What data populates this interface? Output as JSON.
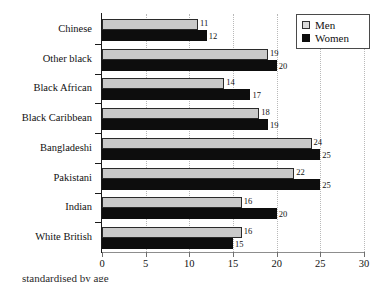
{
  "chart_data": {
    "type": "bar",
    "orientation": "horizontal",
    "title": "",
    "xlabel": "",
    "ylabel": "",
    "xlim": [
      0,
      30
    ],
    "xticks": [
      0,
      5,
      10,
      15,
      20,
      25,
      30
    ],
    "grid": true,
    "grid_axis": "x",
    "legend_position": "top-right",
    "categories": [
      "Chinese",
      "Other black",
      "Black African",
      "Black Caribbean",
      "Bangladeshi",
      "Pakistani",
      "Indian",
      "White British"
    ],
    "series": [
      {
        "name": "Men",
        "color": "#c9c9c9",
        "values": [
          11,
          19,
          14,
          18,
          24,
          22,
          16,
          16
        ]
      },
      {
        "name": "Women",
        "color": "#0d0d0d",
        "values": [
          12,
          20,
          17,
          19,
          25,
          25,
          20,
          15
        ]
      }
    ]
  },
  "legend": {
    "items": [
      {
        "label": "Men"
      },
      {
        "label": "Women"
      }
    ]
  },
  "axis": {
    "tick_labels": [
      "0",
      "5",
      "10",
      "15",
      "20",
      "25",
      "30"
    ]
  },
  "caption": {
    "text": "standardised by age"
  }
}
